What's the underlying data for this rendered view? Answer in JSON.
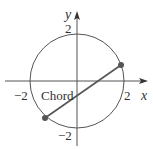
{
  "figure": {
    "circle": {
      "center": [
        0,
        0
      ],
      "radius": 2
    },
    "axes": {
      "x_label": "x",
      "y_label": "y",
      "x_ticks": [
        {
          "value": -2,
          "label": "−2"
        },
        {
          "value": 2,
          "label": "2"
        }
      ],
      "y_ticks": [
        {
          "value": 2,
          "label": "2"
        },
        {
          "value": -2,
          "label": "−2"
        }
      ]
    },
    "chord": {
      "label": "Chord",
      "endpoints": [
        [
          -1.6,
          -1.2
        ],
        [
          1.85,
          0.75
        ]
      ]
    },
    "colors": {
      "stroke": "#555555",
      "point": "#555555",
      "text": "#333333"
    }
  }
}
